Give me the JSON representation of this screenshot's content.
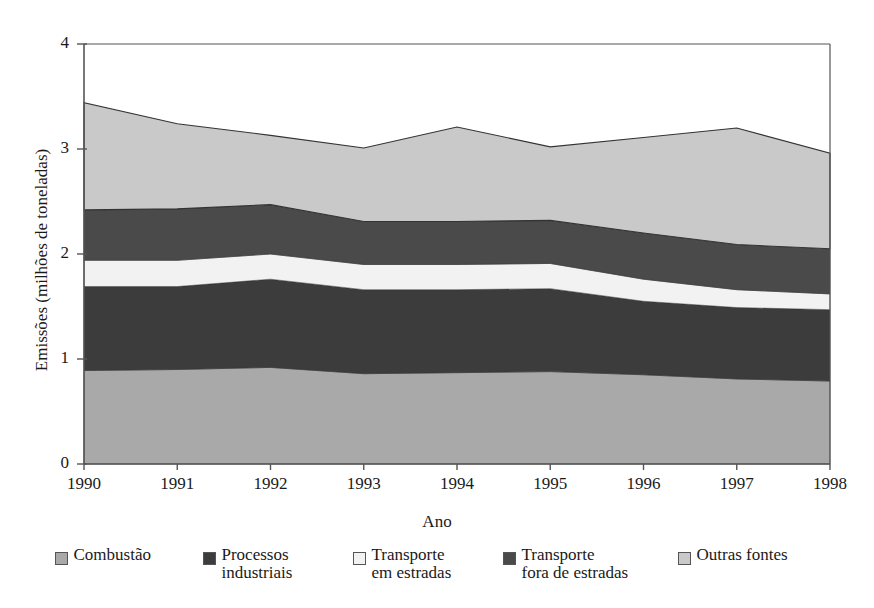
{
  "chart_data": {
    "type": "area",
    "stacked": true,
    "title": "",
    "xlabel": "Ano",
    "ylabel": "Emissões (milhões de toneladas)",
    "x": [
      1990,
      1991,
      1992,
      1993,
      1994,
      1995,
      1996,
      1997,
      1998
    ],
    "xtick_labels": [
      "1990",
      "1991",
      "1992",
      "1993",
      "1994",
      "1995",
      "1996",
      "1997",
      "1998"
    ],
    "ytick_labels": [
      "0",
      "1",
      "2",
      "3",
      "4"
    ],
    "ytick_values": [
      0,
      1,
      2,
      3,
      4
    ],
    "ylim": [
      0,
      4
    ],
    "xlim": [
      1990,
      1998
    ],
    "grid": false,
    "legend_position": "bottom",
    "series": [
      {
        "name": "Combustão",
        "color": "#a9a9a9",
        "values": [
          0.89,
          0.9,
          0.92,
          0.86,
          0.87,
          0.88,
          0.85,
          0.81,
          0.79
        ]
      },
      {
        "name": "Processos industriais",
        "color": "#3c3c3c",
        "values": [
          0.8,
          0.79,
          0.84,
          0.8,
          0.79,
          0.79,
          0.7,
          0.68,
          0.68
        ]
      },
      {
        "name": "Transporte em estradas",
        "color": "#f2f2f2",
        "values": [
          0.25,
          0.25,
          0.24,
          0.24,
          0.24,
          0.24,
          0.21,
          0.17,
          0.15
        ]
      },
      {
        "name": "Transporte fora de estradas",
        "color": "#4a4a4a",
        "values": [
          0.48,
          0.49,
          0.47,
          0.41,
          0.41,
          0.41,
          0.44,
          0.43,
          0.43
        ]
      },
      {
        "name": "Outras fontes",
        "color": "#c9c9c9",
        "values": [
          1.02,
          0.81,
          0.66,
          0.7,
          0.9,
          0.7,
          0.91,
          1.11,
          0.91
        ]
      }
    ],
    "totals": [
      3.44,
      3.24,
      3.13,
      3.01,
      3.21,
      3.02,
      3.11,
      3.2,
      2.96
    ],
    "legend_entries": [
      {
        "label": "Combustão",
        "line1": "Combustão",
        "line2": "",
        "color": "#a9a9a9"
      },
      {
        "label": "Processos industriais",
        "line1": "Processos",
        "line2": "industriais",
        "color": "#3c3c3c"
      },
      {
        "label": "Transporte em estradas",
        "line1": "Transporte",
        "line2": "em estradas",
        "color": "#f2f2f2"
      },
      {
        "label": "Transporte fora de estradas",
        "line1": "Transporte",
        "line2": "fora de estradas",
        "color": "#4a4a4a"
      },
      {
        "label": "Outras fontes",
        "line1": "Outras fontes",
        "line2": "",
        "color": "#c9c9c9"
      }
    ]
  },
  "axis_colors": {
    "axis_line": "#555555",
    "series_outline": "#333333",
    "background": "#ffffff"
  }
}
